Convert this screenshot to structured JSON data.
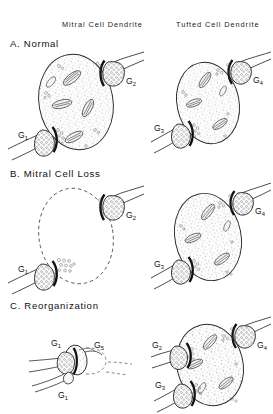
{
  "figure": {
    "title_absent": true,
    "background_color": "#ffffff",
    "ink_color": "#111111",
    "columns": [
      {
        "id": "mitral",
        "label": "Mitral Cell Dendrite"
      },
      {
        "id": "tufted",
        "label": "Tufted Cell Dendrite"
      }
    ],
    "panels": [
      {
        "id": "a",
        "label": "A. Normal",
        "letter": "A",
        "title": "Normal",
        "cells": [
          {
            "column": "mitral",
            "dendrite_state": "intact",
            "outline": "solid",
            "fill": "stippled",
            "terminals": [
              {
                "name": "G1",
                "base": "G",
                "sub": "1",
                "position": "lower-left"
              },
              {
                "name": "G2",
                "base": "G",
                "sub": "2",
                "position": "upper-right"
              }
            ]
          },
          {
            "column": "tufted",
            "dendrite_state": "intact",
            "outline": "solid",
            "fill": "stippled",
            "terminals": [
              {
                "name": "G3",
                "base": "G",
                "sub": "3",
                "position": "lower-left"
              },
              {
                "name": "G4",
                "base": "G",
                "sub": "4",
                "position": "upper-right"
              }
            ]
          }
        ]
      },
      {
        "id": "b",
        "label": "B. Mitral Cell Loss",
        "letter": "B",
        "title": "Mitral Cell Loss",
        "cells": [
          {
            "column": "mitral",
            "dendrite_state": "degenerated",
            "outline": "dashed",
            "fill": "empty",
            "terminals": [
              {
                "name": "G1",
                "base": "G",
                "sub": "1",
                "position": "lower-left"
              },
              {
                "name": "G2",
                "base": "G",
                "sub": "2",
                "position": "upper-right"
              }
            ]
          },
          {
            "column": "tufted",
            "dendrite_state": "intact",
            "outline": "solid",
            "fill": "stippled",
            "terminals": [
              {
                "name": "G3",
                "base": "G",
                "sub": "3",
                "position": "lower-left"
              },
              {
                "name": "G4",
                "base": "G",
                "sub": "4",
                "position": "upper-right"
              }
            ]
          }
        ]
      },
      {
        "id": "c",
        "label": "C. Reorganization",
        "letter": "C",
        "title": "Reorganization",
        "cells": [
          {
            "column": "mitral",
            "dendrite_state": "collapsed",
            "outline": "dashed-remnant",
            "fill": "small-stippled",
            "terminals": [
              {
                "name": "G1",
                "base": "G",
                "sub": "1",
                "position": "upper-left"
              },
              {
                "name": "G5",
                "base": "G",
                "sub": "5",
                "position": "upper-right"
              },
              {
                "name": "G1b",
                "base": "G",
                "sub": "1",
                "position": "bottom"
              }
            ]
          },
          {
            "column": "tufted",
            "dendrite_state": "enlarged",
            "outline": "solid",
            "fill": "stippled",
            "terminals": [
              {
                "name": "G2",
                "base": "G",
                "sub": "2",
                "position": "mid-left"
              },
              {
                "name": "G3",
                "base": "G",
                "sub": "3",
                "position": "lower-left"
              },
              {
                "name": "G4",
                "base": "G",
                "sub": "4",
                "position": "upper-right"
              }
            ]
          }
        ]
      }
    ]
  }
}
